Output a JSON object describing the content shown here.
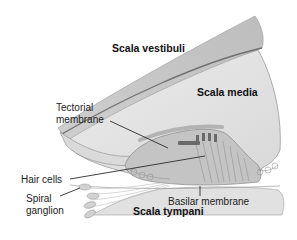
{
  "diagram": {
    "labels": {
      "scala_vestibuli": "Scala vestibuli",
      "scala_media": "Scala media",
      "tectorial_line1": "Tectorial",
      "tectorial_line2": "membrane",
      "hair_cells": "Hair cells",
      "spiral_line1": "Spiral",
      "spiral_line2": "ganglion",
      "basilar_membrane": "Basilar membrane",
      "scala_tympani": "Scala tympani"
    },
    "colors": {
      "membrane_fill": "#d4d4d4",
      "membrane_dark": "#a8a8a8",
      "media_fill": "#e6e6e6",
      "organ_fill": "#bdbdbd",
      "tympani_fill": "#e2e2e2",
      "line": "#333333"
    }
  }
}
